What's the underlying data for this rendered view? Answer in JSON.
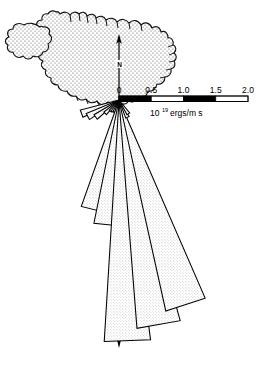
{
  "figure": {
    "background_color": "#ffffff",
    "ink_color": "#000000"
  },
  "map": {
    "name": "Iceland",
    "fill_color": "#ffffff",
    "stipple_color": "#555555",
    "outline_color": "#000000"
  },
  "north_indicator": {
    "label": "N",
    "orientation": "up"
  },
  "south_indicator": {
    "label": "",
    "orientation": "down"
  },
  "scalebar": {
    "tick_labels": [
      "0",
      "0.5",
      "1.0",
      "1.5",
      "2.0"
    ],
    "tick_values": [
      0,
      0.5,
      1.0,
      1.5,
      2.0
    ],
    "unit_mantissa": "10",
    "unit_exponent": "19",
    "unit_rest": "ergs/m  s",
    "unit_full": "10¹⁹ ergs/m  s",
    "segment_fills": [
      "#000000",
      "#ffffff",
      "#000000",
      "#ffffff"
    ]
  },
  "chart_data": {
    "type": "bar",
    "subtype": "rose-diagram",
    "xlabel": "Direction (degrees from North, clockwise)",
    "ylabel": "Energy flux",
    "value_unit": "10^19 ergs/m s",
    "radial_axis": {
      "min": 0,
      "max": 2.0,
      "ticks": [
        0,
        0.5,
        1.0,
        1.5,
        2.0
      ],
      "tick_labels": [
        "0",
        "0.5",
        "1.0",
        "1.5",
        "2.0"
      ],
      "axis_direction_deg": 90,
      "pixels_per_unit": 64.5
    },
    "grid": false,
    "legend": "none",
    "origin_px": [
      119,
      100
    ],
    "petal_half_width_deg": 5.5,
    "petal_fill": "#e3e3e3",
    "petal_stroke": "#000000",
    "categories": [
      "250",
      "242",
      "234",
      "226",
      "218",
      "210",
      "202",
      "194",
      "186",
      "178",
      "170",
      "162",
      "154",
      "146"
    ],
    "values": [
      0.62,
      0.55,
      0.45,
      0.3,
      0.22,
      0.21,
      0.2,
      1.75,
      1.95,
      3.75,
      3.55,
      3.35,
      0.3,
      0.26
    ],
    "series": [
      {
        "name": "Energy flux",
        "bearings_deg": [
          250,
          242,
          234,
          226,
          218,
          210,
          202,
          194,
          186,
          178,
          170,
          162,
          154,
          146
        ],
        "values": [
          0.62,
          0.55,
          0.45,
          0.3,
          0.22,
          0.21,
          0.2,
          1.75,
          1.95,
          3.75,
          3.55,
          3.35,
          0.3,
          0.26
        ]
      }
    ]
  }
}
